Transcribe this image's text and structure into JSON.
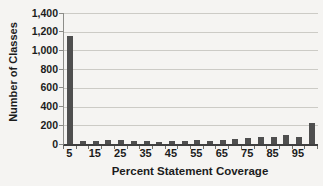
{
  "figure": {
    "background": "#f5f4f2"
  },
  "chart_data": {
    "type": "bar",
    "title": "",
    "xlabel": "Percent Statement Coverage",
    "ylabel": "Number of Classes",
    "categories": [
      5,
      10,
      15,
      20,
      25,
      30,
      35,
      40,
      45,
      50,
      55,
      60,
      65,
      70,
      75,
      80,
      85,
      90,
      95,
      100
    ],
    "values": [
      1150,
      30,
      30,
      40,
      40,
      35,
      30,
      25,
      35,
      35,
      40,
      35,
      40,
      50,
      60,
      70,
      80,
      95,
      75,
      220
    ],
    "x_tick_labels": [
      "5",
      "15",
      "25",
      "35",
      "45",
      "55",
      "65",
      "75",
      "85",
      "95"
    ],
    "y_tick_values": [
      0,
      200,
      400,
      600,
      800,
      1000,
      1200,
      1400
    ],
    "y_tick_labels": [
      "0",
      "200",
      "400",
      "600",
      "800",
      "1,000",
      "1,200",
      "1,400"
    ],
    "ylim": [
      0,
      1400
    ],
    "grid": true,
    "legend": "none",
    "bar_color": "#4f4f4f",
    "grid_color": "#cccbc6",
    "axis_color": "#3f3f3f",
    "text_color": "#1c1c1c"
  }
}
